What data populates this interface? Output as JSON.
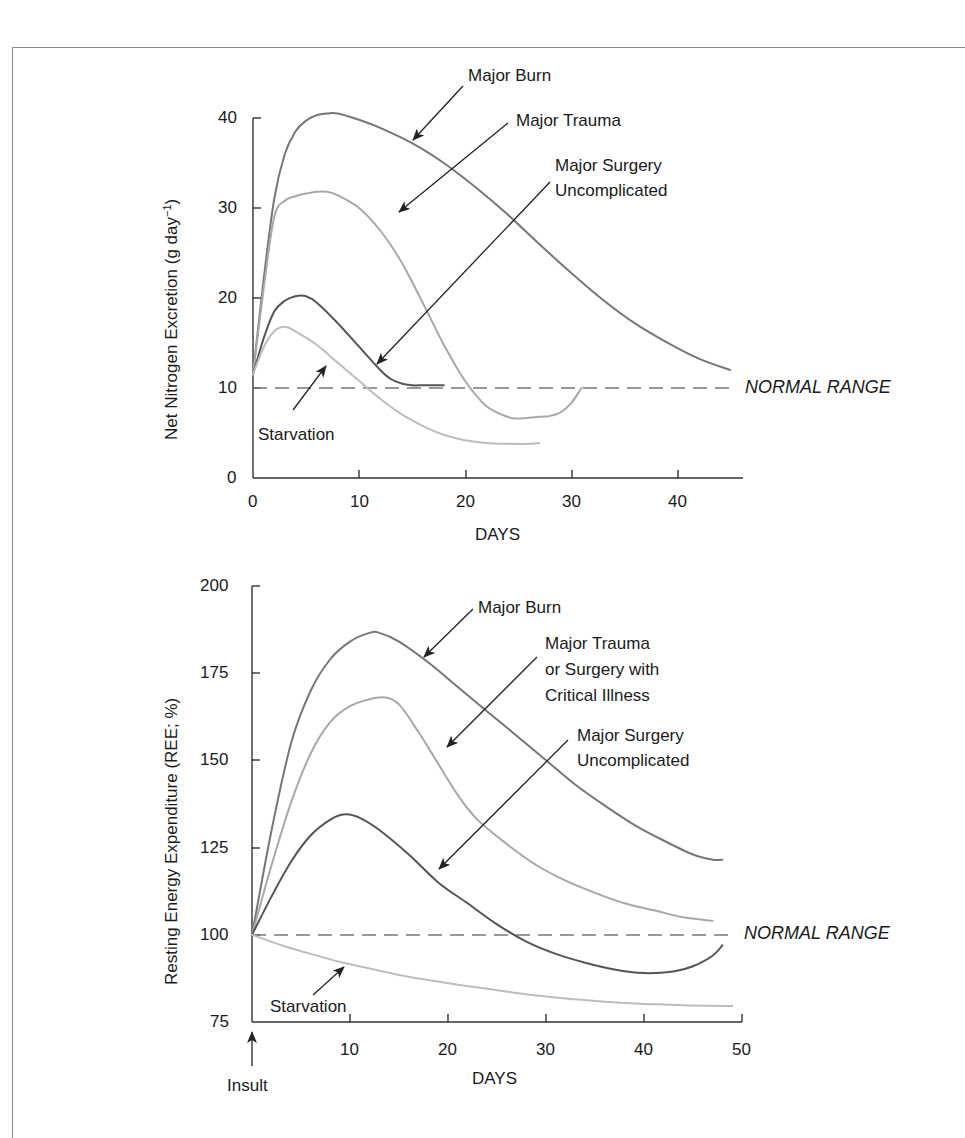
{
  "colors": {
    "axis": "#333333",
    "normal_dash": "#777777",
    "major_burn": "#777777",
    "major_trauma": "#a8a8a8",
    "major_surgery": "#555555",
    "starvation": "#bdbdbd",
    "arrow": "#222222"
  },
  "chart_data": [
    {
      "type": "line",
      "title": "",
      "xlabel": "DAYS",
      "ylabel": "Net Nitrogen Excretion (g day⁻¹)",
      "xlim": [
        0,
        46
      ],
      "ylim": [
        0,
        40
      ],
      "x_ticks": [
        0,
        10,
        20,
        30,
        40
      ],
      "y_ticks": [
        0,
        10,
        20,
        30,
        40
      ],
      "grid": false,
      "reference_line": {
        "y": 10,
        "label": "NORMAL RANGE",
        "style": "dashed"
      },
      "series": [
        {
          "name": "Major Burn",
          "color_key": "major_burn",
          "points": [
            [
              0,
              11.5
            ],
            [
              1,
              22
            ],
            [
              2,
              31
            ],
            [
              3,
              36
            ],
            [
              4,
              38.5
            ],
            [
              5,
              39.7
            ],
            [
              6,
              40.3
            ],
            [
              7,
              40.5
            ],
            [
              8,
              40.5
            ],
            [
              10,
              39.8
            ],
            [
              12,
              38.9
            ],
            [
              15,
              37.2
            ],
            [
              18,
              35
            ],
            [
              21,
              32.3
            ],
            [
              24,
              29.3
            ],
            [
              27,
              26
            ],
            [
              30,
              22.8
            ],
            [
              33,
              19.8
            ],
            [
              36,
              17.2
            ],
            [
              39,
              15.1
            ],
            [
              42,
              13.3
            ],
            [
              45,
              12
            ]
          ]
        },
        {
          "name": "Major Trauma",
          "color_key": "major_trauma",
          "points": [
            [
              0,
              11.5
            ],
            [
              1,
              21
            ],
            [
              2,
              29
            ],
            [
              3,
              30.8
            ],
            [
              4,
              31.3
            ],
            [
              5,
              31.6
            ],
            [
              6,
              31.8
            ],
            [
              7,
              31.8
            ],
            [
              8,
              31.4
            ],
            [
              10,
              30
            ],
            [
              12,
              27.5
            ],
            [
              14,
              24
            ],
            [
              16,
              19.5
            ],
            [
              18,
              14.8
            ],
            [
              20,
              10.8
            ],
            [
              22,
              8
            ],
            [
              24,
              6.8
            ],
            [
              25,
              6.6
            ],
            [
              27,
              6.8
            ],
            [
              28,
              6.9
            ],
            [
              29,
              7.3
            ],
            [
              30,
              8.3
            ],
            [
              31,
              10
            ]
          ]
        },
        {
          "name": "Major Surgery Uncomplicated",
          "color_key": "major_surgery",
          "points": [
            [
              0,
              11.5
            ],
            [
              1,
              15.5
            ],
            [
              2,
              18.5
            ],
            [
              3,
              19.7
            ],
            [
              4,
              20.2
            ],
            [
              5,
              20.2
            ],
            [
              6,
              19.5
            ],
            [
              8,
              17.2
            ],
            [
              10,
              14.6
            ],
            [
              12,
              12
            ],
            [
              13,
              11
            ],
            [
              14,
              10.5
            ],
            [
              15,
              10.3
            ],
            [
              16,
              10.3
            ],
            [
              17,
              10.3
            ],
            [
              18,
              10.3
            ]
          ]
        },
        {
          "name": "Starvation",
          "color_key": "starvation",
          "points": [
            [
              0,
              11.5
            ],
            [
              1,
              14.5
            ],
            [
              2,
              16.3
            ],
            [
              3,
              16.8
            ],
            [
              4,
              16.3
            ],
            [
              6,
              14.8
            ],
            [
              8,
              12.8
            ],
            [
              10,
              10.8
            ],
            [
              12,
              8.8
            ],
            [
              14,
              7.1
            ],
            [
              16,
              5.8
            ],
            [
              18,
              4.8
            ],
            [
              20,
              4.2
            ],
            [
              22,
              3.9
            ],
            [
              24,
              3.8
            ],
            [
              26,
              3.8
            ],
            [
              27,
              3.9
            ]
          ]
        }
      ],
      "annotations": [
        {
          "text": "Major Burn",
          "series": "Major Burn"
        },
        {
          "text": "Major Trauma",
          "series": "Major Trauma"
        },
        {
          "text": "Major Surgery Uncomplicated",
          "series": "Major Surgery Uncomplicated"
        },
        {
          "text": "Starvation",
          "series": "Starvation"
        }
      ]
    },
    {
      "type": "line",
      "title": "",
      "xlabel": "DAYS",
      "ylabel": "Resting Energy Expenditure (REE; %)",
      "xlim": [
        0,
        50
      ],
      "ylim": [
        75,
        200
      ],
      "x_ticks": [
        10,
        20,
        30,
        40,
        50
      ],
      "y_ticks": [
        75,
        100,
        125,
        150,
        175,
        200
      ],
      "grid": false,
      "reference_line": {
        "y": 100,
        "label": "NORMAL RANGE",
        "style": "dashed"
      },
      "x_marker": {
        "x": 0,
        "label": "Insult"
      },
      "series": [
        {
          "name": "Major Burn",
          "color_key": "major_burn",
          "points": [
            [
              0,
              100
            ],
            [
              2,
              130
            ],
            [
              4,
              155
            ],
            [
              6,
              170
            ],
            [
              8,
              179
            ],
            [
              10,
              184
            ],
            [
              12,
              186.5
            ],
            [
              13,
              186.5
            ],
            [
              15,
              184
            ],
            [
              18,
              178
            ],
            [
              21,
              171
            ],
            [
              24,
              164
            ],
            [
              27,
              157
            ],
            [
              30,
              150
            ],
            [
              33,
              143
            ],
            [
              36,
              137
            ],
            [
              39,
              131.5
            ],
            [
              42,
              127
            ],
            [
              45,
              123
            ],
            [
              47,
              121.5
            ],
            [
              48,
              121.5
            ]
          ]
        },
        {
          "name": "Major Trauma or Surgery with Critical Illness",
          "color_key": "major_trauma",
          "points": [
            [
              0,
              100
            ],
            [
              2,
              120
            ],
            [
              4,
              138
            ],
            [
              6,
              152
            ],
            [
              8,
              161
            ],
            [
              10,
              165.5
            ],
            [
              12,
              167.5
            ],
            [
              13.5,
              168
            ],
            [
              15,
              166
            ],
            [
              17,
              158
            ],
            [
              19,
              149
            ],
            [
              21,
              140
            ],
            [
              23,
              133
            ],
            [
              26,
              126
            ],
            [
              29,
              120
            ],
            [
              32,
              115.5
            ],
            [
              35,
              112
            ],
            [
              38,
              109
            ],
            [
              41,
              107
            ],
            [
              44,
              105
            ],
            [
              47,
              104
            ]
          ]
        },
        {
          "name": "Major Surgery Uncomplicated",
          "color_key": "major_surgery",
          "points": [
            [
              0,
              100
            ],
            [
              2,
              111
            ],
            [
              4,
              121
            ],
            [
              6,
              128.5
            ],
            [
              8,
              133
            ],
            [
              9.5,
              134.5
            ],
            [
              11,
              133.5
            ],
            [
              13,
              130
            ],
            [
              16,
              123
            ],
            [
              19,
              115
            ],
            [
              22,
              109
            ],
            [
              25,
              103
            ],
            [
              28,
              98
            ],
            [
              31,
              94.5
            ],
            [
              34,
              92
            ],
            [
              37,
              90
            ],
            [
              40,
              89
            ],
            [
              43,
              89.5
            ],
            [
              45,
              91
            ],
            [
              47,
              94
            ],
            [
              48,
              97
            ]
          ]
        },
        {
          "name": "Starvation",
          "color_key": "starvation",
          "points": [
            [
              0,
              100
            ],
            [
              3,
              97
            ],
            [
              6,
              94.5
            ],
            [
              9,
              92.2
            ],
            [
              12,
              90.3
            ],
            [
              15,
              88.5
            ],
            [
              18,
              87
            ],
            [
              21,
              85.7
            ],
            [
              24,
              84.5
            ],
            [
              27,
              83.3
            ],
            [
              30,
              82.3
            ],
            [
              33,
              81.5
            ],
            [
              36,
              80.8
            ],
            [
              39,
              80.3
            ],
            [
              42,
              80
            ],
            [
              45,
              79.7
            ],
            [
              48,
              79.6
            ],
            [
              49,
              79.6
            ]
          ]
        }
      ],
      "annotations": [
        {
          "text": "Major Burn",
          "series": "Major Burn"
        },
        {
          "text": "Major Trauma or Surgery with Critical Illness",
          "series": "Major Trauma or Surgery with Critical Illness"
        },
        {
          "text": "Major Surgery Uncomplicated",
          "series": "Major Surgery Uncomplicated"
        },
        {
          "text": "Starvation",
          "series": "Starvation"
        }
      ]
    }
  ],
  "top": {
    "ylabel_main": "Net Nitrogen Excretion (g day",
    "ylabel_sup": "−1",
    "ylabel_close": ")",
    "xlabel": "DAYS",
    "y_tick_labels": [
      "40",
      "30",
      "20",
      "10",
      "0"
    ],
    "x_tick_labels": [
      "0",
      "10",
      "20",
      "30",
      "40"
    ],
    "normal_range": "NORMAL RANGE",
    "labels": {
      "burn": "Major Burn",
      "trauma": "Major Trauma",
      "surgery_line1": "Major Surgery",
      "surgery_line2": "Uncomplicated",
      "starvation": "Starvation"
    }
  },
  "bottom": {
    "ylabel": "Resting Energy Expenditure (REE; %)",
    "xlabel": "DAYS",
    "y_tick_labels": [
      "200",
      "175",
      "150",
      "125",
      "100",
      "75"
    ],
    "x_tick_labels": [
      "10",
      "20",
      "30",
      "40",
      "50"
    ],
    "normal_range": "NORMAL RANGE",
    "insult": "Insult",
    "labels": {
      "burn": "Major Burn",
      "trauma_line1": "Major Trauma",
      "trauma_line2": "or Surgery with",
      "trauma_line3": "Critical Illness",
      "surgery_line1": "Major Surgery",
      "surgery_line2": "Uncomplicated",
      "starvation": "Starvation"
    }
  }
}
